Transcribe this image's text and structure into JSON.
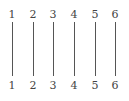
{
  "diagram": {
    "type": "permutation-identity",
    "top_labels": [
      "1",
      "2",
      "3",
      "4",
      "5",
      "6"
    ],
    "bottom_labels": [
      "1",
      "2",
      "3",
      "4",
      "5",
      "6"
    ],
    "connections": [
      [
        1,
        1
      ],
      [
        2,
        2
      ],
      [
        3,
        3
      ],
      [
        4,
        4
      ],
      [
        5,
        5
      ],
      [
        6,
        6
      ]
    ],
    "line_color": "#555555",
    "text_color": "#444444"
  }
}
